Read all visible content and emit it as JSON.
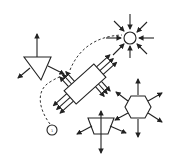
{
  "diagram": {
    "colors": {
      "stroke": "#222222",
      "background": "#ffffff"
    },
    "nodes": [
      {
        "id": "sun",
        "shape": "circle",
        "arrows": "inward",
        "arrow_count": 8
      },
      {
        "id": "triangle",
        "shape": "inverted-triangle",
        "arrows": "outward",
        "arrow_count": 3
      },
      {
        "id": "connector",
        "shape": "rotated-rectangle",
        "arrows": "outward-parallel",
        "arrow_count": 12
      },
      {
        "id": "hexagon",
        "shape": "hexagon",
        "arrows": "outward",
        "arrow_count": 6
      },
      {
        "id": "trapezoid",
        "shape": "trapezoid",
        "arrows": "outward",
        "arrow_count": 4
      },
      {
        "id": "small-circle",
        "shape": "circle",
        "arrows": "none",
        "label": "1"
      }
    ],
    "edges": [
      {
        "from": "small-circle",
        "to": "connector",
        "style": "dashed"
      },
      {
        "from": "connector",
        "to": "sun",
        "style": "dashed"
      }
    ]
  }
}
